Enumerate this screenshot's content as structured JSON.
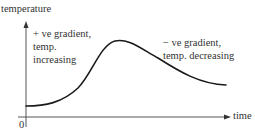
{
  "diagram": {
    "type": "temperature-time graph",
    "y_axis": {
      "label": "temperature"
    },
    "x_axis": {
      "label": "time"
    },
    "origin": {
      "label": "0"
    },
    "annotations": {
      "rising": {
        "lines": [
          "+ ve gradient,",
          "temp.",
          "increasing"
        ]
      },
      "falling": {
        "lines": [
          "− ve gradient,",
          "temp. decreasing"
        ]
      }
    },
    "curve": {
      "description": "rises from a low start, peaks, then decreases",
      "start": {
        "x": 26,
        "y": 106
      },
      "peak": {
        "x": 115,
        "y": 41
      },
      "end": {
        "x": 226,
        "y": 85
      }
    },
    "colors": {
      "curve": "#1a1a1a",
      "axes": "#555555",
      "text": "#333333"
    }
  }
}
